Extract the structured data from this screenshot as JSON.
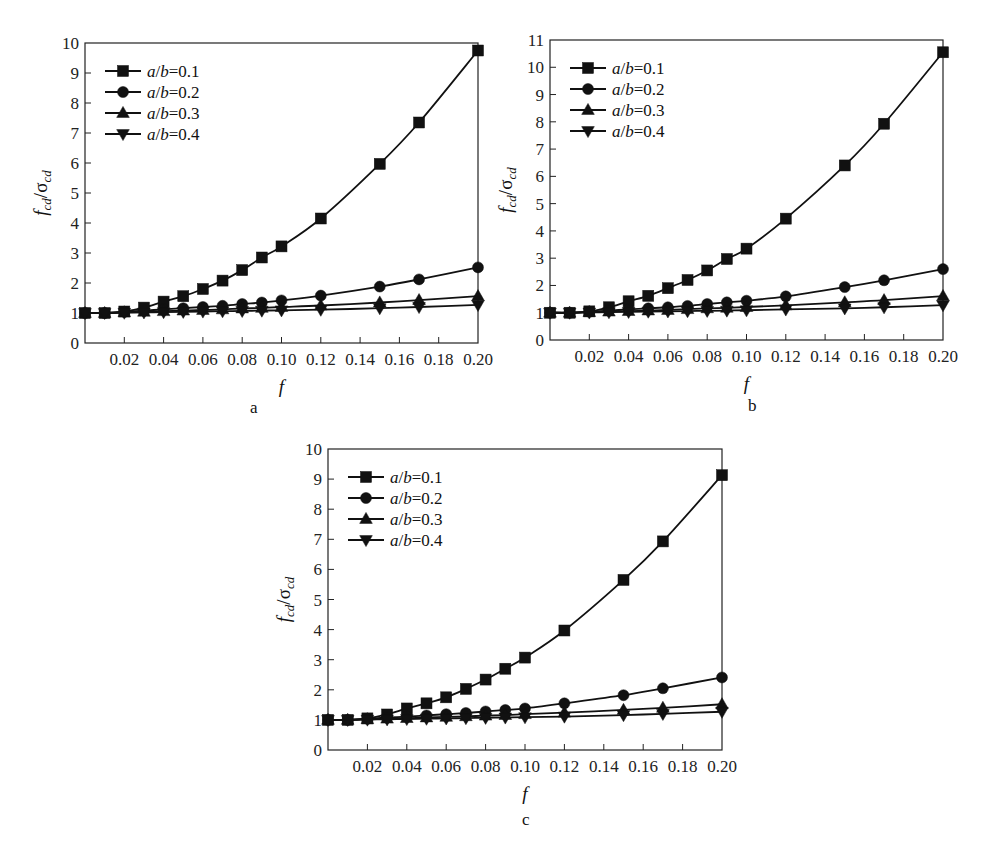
{
  "figure": {
    "panel_labels": [
      "a",
      "b",
      "c"
    ]
  },
  "chart_data": [
    {
      "type": "line",
      "panel": "a",
      "title": "",
      "xlabel": "f",
      "ylabel": "f_cd/σ_cd",
      "xlim": [
        0,
        0.2
      ],
      "ylim": [
        0,
        10
      ],
      "xticks": [
        "0.02",
        "0.04",
        "0.06",
        "0.08",
        "0.10",
        "0.12",
        "0.14",
        "0.16",
        "0.18",
        "0.20"
      ],
      "yticks": [
        "0",
        "1",
        "2",
        "3",
        "4",
        "5",
        "6",
        "7",
        "8",
        "9",
        "10"
      ],
      "grid": false,
      "legend_position": "upper left",
      "x": [
        0,
        0.01,
        0.02,
        0.03,
        0.04,
        0.05,
        0.06,
        0.07,
        0.08,
        0.09,
        0.1,
        0.12,
        0.15,
        0.17,
        0.2
      ],
      "series": [
        {
          "name": "a/b=0.1",
          "marker": "square",
          "values": [
            1.0,
            1.0,
            1.05,
            1.18,
            1.38,
            1.56,
            1.8,
            2.08,
            2.43,
            2.85,
            3.22,
            4.15,
            5.97,
            7.35,
            9.75
          ]
        },
        {
          "name": "a/b=0.2",
          "marker": "circle",
          "values": [
            1.0,
            1.0,
            1.04,
            1.08,
            1.12,
            1.16,
            1.2,
            1.24,
            1.3,
            1.35,
            1.42,
            1.58,
            1.88,
            2.12,
            2.52
          ]
        },
        {
          "name": "a/b=0.3",
          "marker": "triangle-up",
          "values": [
            1.0,
            1.0,
            1.02,
            1.04,
            1.06,
            1.08,
            1.1,
            1.12,
            1.15,
            1.17,
            1.2,
            1.25,
            1.35,
            1.43,
            1.56
          ]
        },
        {
          "name": "a/b=0.4",
          "marker": "triangle-down",
          "values": [
            1.0,
            1.0,
            1.01,
            1.02,
            1.03,
            1.04,
            1.05,
            1.06,
            1.07,
            1.08,
            1.09,
            1.11,
            1.16,
            1.2,
            1.27
          ]
        }
      ]
    },
    {
      "type": "line",
      "panel": "b",
      "title": "",
      "xlabel": "f",
      "ylabel": "f_cd/σ_cd",
      "xlim": [
        0,
        0.2
      ],
      "ylim": [
        0,
        11
      ],
      "xticks": [
        "0.02",
        "0.04",
        "0.06",
        "0.08",
        "0.10",
        "0.12",
        "0.14",
        "0.16",
        "0.18",
        "0.20"
      ],
      "yticks": [
        "0",
        "1",
        "2",
        "3",
        "4",
        "5",
        "6",
        "7",
        "8",
        "9",
        "10",
        "11"
      ],
      "grid": false,
      "legend_position": "upper left",
      "x": [
        0,
        0.01,
        0.02,
        0.03,
        0.04,
        0.05,
        0.06,
        0.07,
        0.08,
        0.09,
        0.1,
        0.12,
        0.15,
        0.17,
        0.2
      ],
      "series": [
        {
          "name": "a/b=0.1",
          "marker": "square",
          "values": [
            1.0,
            1.0,
            1.05,
            1.2,
            1.42,
            1.62,
            1.9,
            2.2,
            2.55,
            2.97,
            3.35,
            4.45,
            6.4,
            7.93,
            10.55
          ]
        },
        {
          "name": "a/b=0.2",
          "marker": "circle",
          "values": [
            1.0,
            1.0,
            1.04,
            1.08,
            1.12,
            1.16,
            1.2,
            1.25,
            1.32,
            1.38,
            1.44,
            1.6,
            1.94,
            2.19,
            2.6
          ]
        },
        {
          "name": "a/b=0.3",
          "marker": "triangle-up",
          "values": [
            1.0,
            1.0,
            1.02,
            1.04,
            1.06,
            1.08,
            1.1,
            1.13,
            1.16,
            1.18,
            1.21,
            1.27,
            1.38,
            1.46,
            1.61
          ]
        },
        {
          "name": "a/b=0.4",
          "marker": "triangle-down",
          "values": [
            1.0,
            1.0,
            1.01,
            1.02,
            1.03,
            1.04,
            1.05,
            1.06,
            1.07,
            1.08,
            1.09,
            1.12,
            1.16,
            1.2,
            1.28
          ]
        }
      ]
    },
    {
      "type": "line",
      "panel": "c",
      "title": "",
      "xlabel": "f",
      "ylabel": "f_cd/σ_cd",
      "xlim": [
        0,
        0.2
      ],
      "ylim": [
        0,
        10
      ],
      "xticks": [
        "0.02",
        "0.04",
        "0.06",
        "0.08",
        "0.10",
        "0.12",
        "0.14",
        "0.16",
        "0.18",
        "0.20"
      ],
      "yticks": [
        "0",
        "1",
        "2",
        "3",
        "4",
        "5",
        "6",
        "7",
        "8",
        "9",
        "10"
      ],
      "grid": false,
      "legend_position": "upper left",
      "x": [
        0,
        0.01,
        0.02,
        0.03,
        0.04,
        0.05,
        0.06,
        0.07,
        0.08,
        0.09,
        0.1,
        0.12,
        0.15,
        0.17,
        0.2
      ],
      "series": [
        {
          "name": "a/b=0.1",
          "marker": "square",
          "values": [
            1.0,
            1.0,
            1.05,
            1.18,
            1.38,
            1.55,
            1.75,
            2.03,
            2.34,
            2.7,
            3.07,
            3.97,
            5.65,
            6.93,
            9.13
          ]
        },
        {
          "name": "a/b=0.2",
          "marker": "circle",
          "values": [
            1.0,
            1.0,
            1.04,
            1.08,
            1.11,
            1.15,
            1.19,
            1.23,
            1.28,
            1.33,
            1.38,
            1.55,
            1.82,
            2.05,
            2.41
          ]
        },
        {
          "name": "a/b=0.3",
          "marker": "triangle-up",
          "values": [
            1.0,
            1.0,
            1.02,
            1.04,
            1.06,
            1.08,
            1.1,
            1.12,
            1.14,
            1.16,
            1.19,
            1.24,
            1.33,
            1.4,
            1.52
          ]
        },
        {
          "name": "a/b=0.4",
          "marker": "triangle-down",
          "values": [
            1.0,
            1.0,
            1.01,
            1.02,
            1.03,
            1.04,
            1.05,
            1.06,
            1.07,
            1.08,
            1.09,
            1.11,
            1.16,
            1.2,
            1.27
          ]
        }
      ]
    }
  ]
}
